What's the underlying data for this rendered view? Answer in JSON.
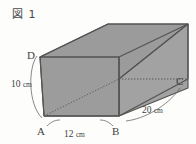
{
  "figure": {
    "caption": "図 1",
    "shape_name": "rectangular-prism"
  },
  "vertices": {
    "a": "A",
    "b": "B",
    "c": "C",
    "d": "D"
  },
  "dimensions": {
    "height": "10 cm",
    "height_value": 10,
    "width": "12 cm",
    "width_value": 12,
    "depth": "20 cm",
    "depth_value": 20,
    "unit": "cm"
  },
  "colors": {
    "fill_front": "#9d9d9d",
    "fill_top": "#9a9a9a",
    "fill_right": "#a3a3a3",
    "stroke": "#4f4f4f",
    "text": "#3f3f3f",
    "background": "#fdfdfc"
  }
}
